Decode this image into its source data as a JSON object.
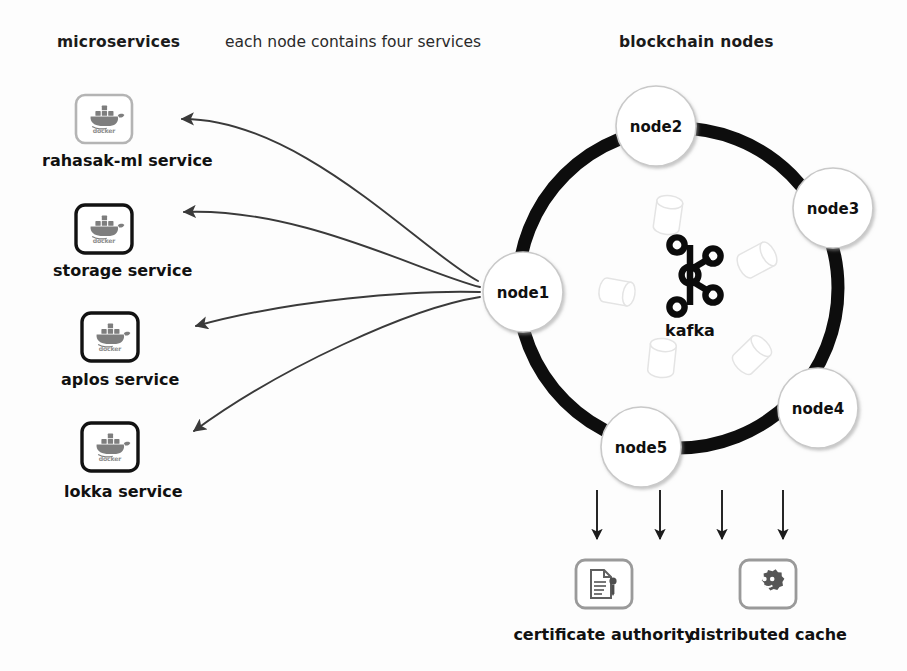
{
  "canvas": {
    "width": 907,
    "height": 671,
    "background": "#fdfdfd"
  },
  "palette": {
    "ink": "#111111",
    "ring": "#0d0d0d",
    "arrow": "#3a3a3a",
    "icon_gray": "#7d7d7d",
    "icon_border_light": "#b4b4b4",
    "icon_border_dark": "#121212",
    "cylinder_faint": "#e8e8e8",
    "node_stroke": "#c9c9c9"
  },
  "headings": {
    "microservices": "microservices",
    "each_node": "each node contains four services",
    "blockchain_nodes": "blockchain nodes"
  },
  "microservices": [
    {
      "id": "rahasak-ml",
      "label": "rahasak-ml service",
      "icon": "docker-whale-icon",
      "icon_caption": "docker",
      "border": "light",
      "box": {
        "x": 76,
        "y": 95,
        "w": 56,
        "h": 48
      },
      "label_pos": {
        "x": 42,
        "y": 160
      },
      "arrow_tip": {
        "x": 174,
        "y": 119
      }
    },
    {
      "id": "storage",
      "label": "storage service",
      "icon": "docker-whale-icon",
      "icon_caption": "docker",
      "border": "dark",
      "box": {
        "x": 76,
        "y": 205,
        "w": 56,
        "h": 48
      },
      "label_pos": {
        "x": 53,
        "y": 270
      },
      "arrow_tip": {
        "x": 176,
        "y": 212
      }
    },
    {
      "id": "aplos",
      "label": "aplos service",
      "icon": "docker-whale-icon",
      "icon_caption": "docker",
      "border": "dark",
      "box": {
        "x": 82,
        "y": 313,
        "w": 56,
        "h": 48
      },
      "label_pos": {
        "x": 61,
        "y": 380
      },
      "arrow_tip": {
        "x": 188,
        "y": 331
      }
    },
    {
      "id": "lokka",
      "label": "lokka service",
      "icon": "docker-whale-icon",
      "icon_caption": "docker",
      "border": "dark",
      "box": {
        "x": 82,
        "y": 423,
        "w": 56,
        "h": 48
      },
      "label_pos": {
        "x": 64,
        "y": 492
      },
      "arrow_tip": {
        "x": 186,
        "y": 437
      }
    }
  ],
  "arrow_origin": {
    "x": 478,
    "y": 281
  },
  "ring": {
    "cx": 678,
    "cy": 288,
    "r": 160,
    "stroke_width": 13,
    "color": "#0d0d0d"
  },
  "blockchain_nodes": [
    {
      "id": "node1",
      "label": "node1",
      "cx": 523,
      "cy": 292,
      "r": 40
    },
    {
      "id": "node2",
      "label": "node2",
      "cx": 656,
      "cy": 126,
      "r": 40
    },
    {
      "id": "node3",
      "label": "node3",
      "cx": 833,
      "cy": 208,
      "r": 40
    },
    {
      "id": "node4",
      "label": "node4",
      "cx": 818,
      "cy": 408,
      "r": 40
    },
    {
      "id": "node5",
      "label": "node5",
      "cx": 641,
      "cy": 447,
      "r": 40
    }
  ],
  "kafka": {
    "label": "kafka",
    "cx": 690,
    "cy": 275,
    "icon": "kafka-logo-icon"
  },
  "cylinders": [
    {
      "cx": 668,
      "cy": 215,
      "w": 26,
      "h": 52,
      "rot": 8
    },
    {
      "cx": 757,
      "cy": 260,
      "w": 26,
      "h": 52,
      "rot": 62
    },
    {
      "cx": 617,
      "cy": 292,
      "w": 24,
      "h": 50,
      "rot": 100
    },
    {
      "cx": 662,
      "cy": 358,
      "w": 25,
      "h": 52,
      "rot": 6
    },
    {
      "cx": 752,
      "cy": 355,
      "w": 25,
      "h": 52,
      "rot": 46
    }
  ],
  "down_arrows": [
    {
      "x": 597,
      "y1": 490,
      "y2": 539
    },
    {
      "x": 660,
      "y1": 490,
      "y2": 539
    },
    {
      "x": 722,
      "y1": 490,
      "y2": 539
    },
    {
      "x": 783,
      "y1": 490,
      "y2": 539
    }
  ],
  "bottom_services": [
    {
      "id": "certificate-authority",
      "label": "certificate authority",
      "icon": "certificate-document-icon",
      "box": {
        "x": 576,
        "y": 560,
        "w": 56,
        "h": 48
      },
      "label_pos": {
        "x": 504,
        "y": 640
      }
    },
    {
      "id": "distributed-cache",
      "label": "distributed cache",
      "icon": "cache-gear-icon",
      "box": {
        "x": 740,
        "y": 560,
        "w": 56,
        "h": 48
      },
      "label_pos": {
        "x": 698,
        "y": 640
      }
    }
  ]
}
